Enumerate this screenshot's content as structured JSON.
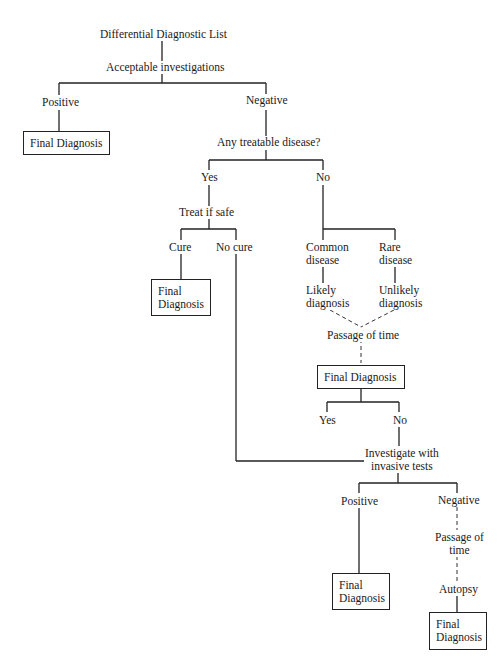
{
  "diagram": {
    "root": "Differential Diagnostic List",
    "step_investigations": "Acceptable investigations",
    "branch_positive": "Positive",
    "branch_negative": "Negative",
    "final_dx_1": "Final Diagnosis",
    "question_treatable": "Any treatable disease?",
    "yes": "Yes",
    "no": "No",
    "treat_if_safe": "Treat if safe",
    "cure": "Cure",
    "no_cure": "No cure",
    "final_dx_2": "Final\nDiagnosis",
    "common_disease": "Common\ndisease",
    "rare_disease": "Rare\ndisease",
    "likely_diagnosis": "Likely\ndiagnosis",
    "unlikely_diagnosis": "Unlikely\ndiagnosis",
    "passage_of_time": "Passage of time",
    "final_dx_3": "Final Diagnosis",
    "fd3_yes": "Yes",
    "fd3_no": "No",
    "invasive_tests": "Investigate with\ninvasive tests",
    "inv_positive": "Positive",
    "inv_negative": "Negative",
    "passage_of_time_2": "Passage of\ntime",
    "autopsy": "Autopsy",
    "final_dx_4": "Final\nDiagnosis",
    "final_dx_5": "Final\nDiagnosis"
  }
}
